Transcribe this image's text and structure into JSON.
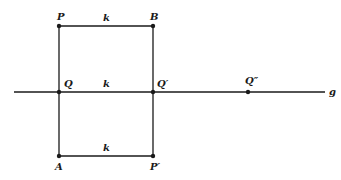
{
  "diagram": {
    "line": {
      "label": "g"
    },
    "points": {
      "P": "P",
      "B": "B",
      "Q": "Q",
      "Q_prime": "Q′",
      "Q_double_prime": "Q″",
      "A": "A",
      "P_prime": "P′"
    },
    "segment_labels": {
      "top": "k",
      "middle": "k",
      "bottom": "k"
    },
    "colors": {
      "ink": "#1a1a1a",
      "background": "#ffffff"
    }
  }
}
